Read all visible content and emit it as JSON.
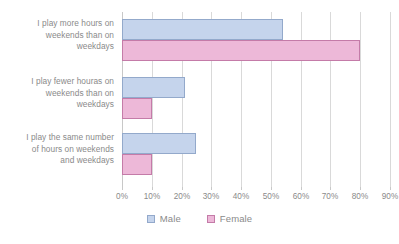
{
  "chart_data": {
    "type": "bar",
    "orientation": "horizontal",
    "title": "",
    "xlabel": "",
    "ylabel": "",
    "xlim": [
      0,
      90
    ],
    "grid": true,
    "legend_position": "bottom",
    "categories": [
      "I play more hours on weekends than on weekdays",
      "I play fewer houras on weekends than on weekdays",
      "I play the same number of hours on weekends and weekdays"
    ],
    "category_lines": [
      [
        "I play more hours on",
        "weekends than on",
        "weekdays"
      ],
      [
        "I play fewer houras on",
        "weekends than on",
        "weekdays"
      ],
      [
        "I play the same number",
        "of hours on weekends",
        "and weekdays"
      ]
    ],
    "series": [
      {
        "name": "Male",
        "color": "#c5d4ec",
        "border_color": "#93a9cb",
        "values": [
          54,
          21,
          25
        ]
      },
      {
        "name": "Female",
        "color": "#edb8d8",
        "border_color": "#c47ba8",
        "values": [
          80,
          10,
          10
        ]
      }
    ],
    "tick_labels": [
      "0%",
      "10%",
      "20%",
      "30%",
      "40%",
      "50%",
      "60%",
      "70%",
      "80%",
      "90%"
    ],
    "tick_values": [
      0,
      10,
      20,
      30,
      40,
      50,
      60,
      70,
      80,
      90
    ]
  },
  "legend": {
    "items": [
      {
        "label": "Male"
      },
      {
        "label": "Female"
      }
    ]
  },
  "colors": {
    "male_fill": "#c5d4ec",
    "male_border": "#93a9cb",
    "female_fill": "#edb8d8",
    "female_border": "#c47ba8",
    "gridline": "#d9d9d9",
    "text": "#8a8a8a",
    "background": "#ffffff"
  }
}
